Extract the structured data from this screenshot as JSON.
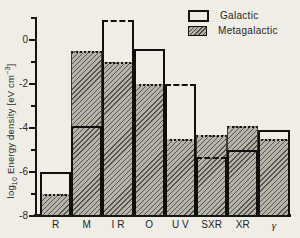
{
  "figure": {
    "background": "#efede6",
    "ink": "#151513"
  },
  "legend": {
    "items": [
      {
        "label": "Galactic",
        "swatch": "open"
      },
      {
        "label": "Metagalactic",
        "swatch": "hatched"
      }
    ]
  },
  "y_axis": {
    "label_parts": {
      "prefix": "log",
      "sub": "10",
      "mid": " Energy density [eV cm",
      "sup": "−3",
      "suffix": "]"
    },
    "major_ticks": [
      0,
      -2,
      -4,
      -6,
      -8
    ],
    "major_tick_labels": [
      "0",
      "-2",
      "-4",
      "-6",
      "-8"
    ],
    "minor_ticks": [
      1,
      -1,
      -3,
      -5,
      -7
    ]
  },
  "chart_data": {
    "type": "bar",
    "title": "",
    "xlabel": "",
    "ylabel": "log10 Energy density [eV cm^-3]",
    "ylim": [
      -8,
      1
    ],
    "grid": false,
    "legend_position": "top-right",
    "categories": [
      "R",
      "M",
      "IR",
      "O",
      "UV",
      "SXR",
      "XR",
      "gamma"
    ],
    "category_display": [
      "R",
      "M",
      "I R",
      "O",
      "U V",
      "SXR",
      "XR",
      "γ"
    ],
    "series": [
      {
        "name": "Galactic",
        "style": "open-outline",
        "values": [
          -6.0,
          -3.9,
          0.9,
          -0.4,
          -2.0,
          -5.3,
          -5.0,
          -4.1
        ],
        "top_edge": [
          "solid",
          "solid",
          "dashed",
          "solid",
          "dashed",
          "dashed",
          "solid",
          "solid"
        ]
      },
      {
        "name": "Metagalactic",
        "style": "hatched",
        "values": [
          -7.0,
          -0.5,
          -1.0,
          -2.0,
          -4.5,
          -4.3,
          -3.9,
          -4.5
        ],
        "top_edge": [
          "dotted",
          "dotted",
          "dotted",
          "dotted",
          "dotted",
          "dotted",
          "dotted",
          "dotted"
        ]
      }
    ]
  }
}
